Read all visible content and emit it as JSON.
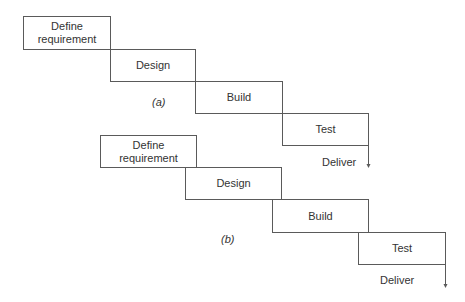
{
  "diagram_a": {
    "caption": "(a)",
    "steps": [
      "Define requirement",
      "Design",
      "Build",
      "Test"
    ],
    "end_label": "Deliver",
    "variant": "sequential (no overlap)"
  },
  "diagram_b": {
    "caption": "(b)",
    "steps": [
      "Define requirement",
      "Design",
      "Build",
      "Test"
    ],
    "end_label": "Deliver",
    "variant": "overlapping phases"
  },
  "colors": {
    "line": "#5a5a5a",
    "text": "#333333",
    "background": "#ffffff"
  }
}
